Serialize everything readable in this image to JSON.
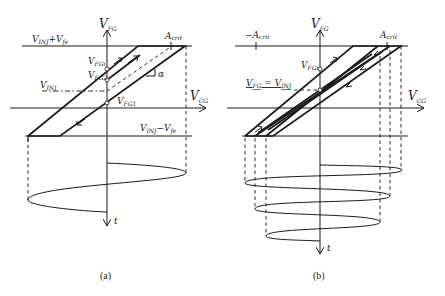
{
  "panels": [
    {
      "id": "a",
      "caption": "(a)",
      "y_axis": {
        "label": "V",
        "sub": "FG"
      },
      "x_axis": {
        "label": "V",
        "sub": "CG"
      },
      "t_axis": {
        "label": "t"
      },
      "top_level": {
        "label": "V",
        "sub1": "INJ",
        "mid": "+V",
        "sub2": "fe"
      },
      "bottom_level": {
        "label": "V",
        "sub1": "INJ",
        "mid": "−V",
        "sub2": "fe"
      },
      "inj_level": {
        "label": "V",
        "sub": "INJ"
      },
      "points": [
        {
          "label": "V",
          "sub": "FGi"
        },
        {
          "label": "V",
          "sub": "FG2"
        },
        {
          "label": "V",
          "sub": "FG1"
        }
      ],
      "a_crit": {
        "label": "A",
        "sub": "crit"
      },
      "slope_label": "α"
    },
    {
      "id": "b",
      "caption": "(b)",
      "y_axis": {
        "label": "V",
        "sub": "FG"
      },
      "x_axis": {
        "label": "V",
        "sub": "CG"
      },
      "t_axis": {
        "label": "t"
      },
      "neg_a_crit": {
        "label": "−A",
        "sub": "crit"
      },
      "a_crit": {
        "label": "A",
        "sub": "crit"
      },
      "point": {
        "label": "V",
        "sub": "FGi"
      },
      "equality": {
        "lhs": "V",
        "lhs_sub": "FG",
        "eq": " = ",
        "rhs": "V",
        "rhs_sub": "INJ"
      }
    }
  ]
}
